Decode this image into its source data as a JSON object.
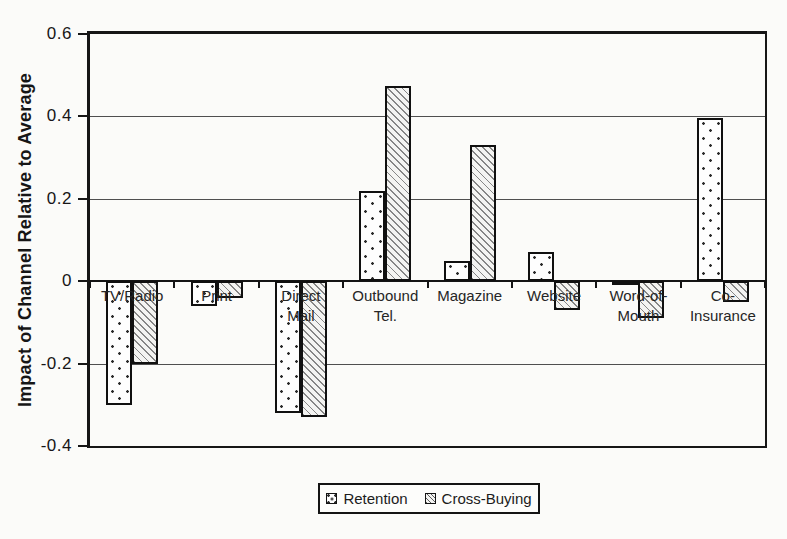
{
  "page": {
    "background": "#fbfbf9",
    "ink_color": "#1a1a1a",
    "hatch_color": "#868686"
  },
  "chart_data": {
    "type": "bar",
    "title": "",
    "xlabel": "",
    "ylabel": "Impact of Channel Relative to Average",
    "ylim": [
      -0.4,
      0.6
    ],
    "ytick_values": [
      0.6,
      0.4,
      0.2,
      0,
      -0.2,
      -0.4
    ],
    "ytick_labels": [
      "0.6",
      "0.4",
      "0.2",
      "0",
      "-0.2",
      "-0.4"
    ],
    "grid": true,
    "legend_position": "bottom",
    "categories": [
      "TV/Radio",
      "Print",
      "Direct Mail",
      "Outbound Tel.",
      "Magazine",
      "Website",
      "Word-of-Mouth",
      "Co-Insurance"
    ],
    "category_label_lines": [
      [
        "TV/Radio"
      ],
      [
        "Print"
      ],
      [
        "Direct",
        "Mail"
      ],
      [
        "Outbound",
        "Tel."
      ],
      [
        "Magazine"
      ],
      [
        "Website"
      ],
      [
        "Word-of-",
        "Mouth"
      ],
      [
        "Co-",
        "Insurance"
      ]
    ],
    "series": [
      {
        "name": "Retention",
        "pattern": "dots",
        "values": [
          -0.3,
          -0.06,
          -0.32,
          0.22,
          0.05,
          0.07,
          -0.01,
          0.395
        ]
      },
      {
        "name": "Cross-Buying",
        "pattern": "diagonal-hatch",
        "values": [
          -0.2,
          -0.04,
          -0.33,
          0.475,
          0.33,
          -0.07,
          -0.09,
          -0.05
        ]
      }
    ]
  }
}
